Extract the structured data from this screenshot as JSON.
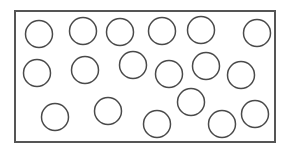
{
  "diagram": {
    "colors": {
      "background": "#ffffff",
      "stroke": "#4a4a4a",
      "frame_stroke": "#555555"
    },
    "frame": {
      "x": 15,
      "y": 11,
      "width": 260,
      "height": 131
    },
    "circle_radius": 13.5,
    "circles": [
      {
        "cx": 39,
        "cy": 34
      },
      {
        "cx": 83,
        "cy": 31
      },
      {
        "cx": 120,
        "cy": 32
      },
      {
        "cx": 162,
        "cy": 31
      },
      {
        "cx": 201,
        "cy": 30
      },
      {
        "cx": 257,
        "cy": 33
      },
      {
        "cx": 37,
        "cy": 73
      },
      {
        "cx": 85,
        "cy": 70
      },
      {
        "cx": 133,
        "cy": 65
      },
      {
        "cx": 169,
        "cy": 74
      },
      {
        "cx": 206,
        "cy": 66
      },
      {
        "cx": 241,
        "cy": 75
      },
      {
        "cx": 55,
        "cy": 117
      },
      {
        "cx": 108,
        "cy": 111
      },
      {
        "cx": 157,
        "cy": 124
      },
      {
        "cx": 191,
        "cy": 102
      },
      {
        "cx": 222,
        "cy": 124
      },
      {
        "cx": 255,
        "cy": 114
      }
    ]
  }
}
